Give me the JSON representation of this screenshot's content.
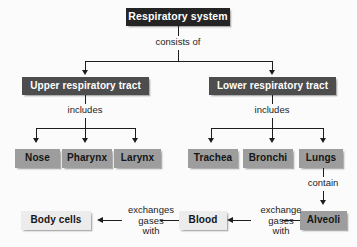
{
  "diagram": {
    "title": "Respiratory system",
    "type": "hierarchical-flowchart",
    "background_color": "#fbfbfb",
    "line_color": "#1d1d1d",
    "nodes": {
      "root": {
        "label": "Respiratory system",
        "level": 1,
        "fill": "#242424",
        "text_color": "#ffffff"
      },
      "upper_tract": {
        "label": "Upper respiratory tract",
        "level": 2,
        "fill": "#4d4d4d",
        "text_color": "#ffffff"
      },
      "lower_tract": {
        "label": "Lower respiratory tract",
        "level": 2,
        "fill": "#4d4d4d",
        "text_color": "#ffffff"
      },
      "nose": {
        "label": "Nose",
        "level": 3,
        "fill": "#9d9d9d",
        "text_color": "#151515"
      },
      "pharynx": {
        "label": "Pharynx",
        "level": 3,
        "fill": "#9d9d9d",
        "text_color": "#151515"
      },
      "larynx": {
        "label": "Larynx",
        "level": 3,
        "fill": "#9d9d9d",
        "text_color": "#151515"
      },
      "trachea": {
        "label": "Trachea",
        "level": 3,
        "fill": "#9d9d9d",
        "text_color": "#151515"
      },
      "bronchi": {
        "label": "Bronchi",
        "level": 3,
        "fill": "#9d9d9d",
        "text_color": "#151515"
      },
      "lungs": {
        "label": "Lungs",
        "level": 3,
        "fill": "#9d9d9d",
        "text_color": "#151515"
      },
      "alveoli": {
        "label": "Alveoli",
        "level": 4,
        "fill": "#9d9d9d",
        "text_color": "#151515"
      },
      "blood": {
        "label": "Blood",
        "level": 4,
        "fill": "#ececed",
        "text_color": "#151515"
      },
      "body_cells": {
        "label": "Body cells",
        "level": 4,
        "fill": "#ececed",
        "text_color": "#151515"
      }
    },
    "edges": {
      "consists_of": {
        "label": "consists of",
        "from": "root",
        "to": [
          "upper_tract",
          "lower_tract"
        ]
      },
      "includes_upper": {
        "label": "includes",
        "from": "upper_tract",
        "to": [
          "nose",
          "pharynx",
          "larynx"
        ]
      },
      "includes_lower": {
        "label": "includes",
        "from": "lower_tract",
        "to": [
          "trachea",
          "bronchi",
          "lungs"
        ]
      },
      "contain": {
        "label": "contain",
        "from": "lungs",
        "to": [
          "alveoli"
        ]
      },
      "alveoli_blood": {
        "line1": "exchange",
        "line2": "gases",
        "line3": "with",
        "from": "alveoli",
        "to": [
          "blood"
        ]
      },
      "blood_cells": {
        "line1": "exchanges",
        "line2": "gases",
        "line3": "with",
        "from": "blood",
        "to": [
          "body_cells"
        ]
      }
    }
  }
}
